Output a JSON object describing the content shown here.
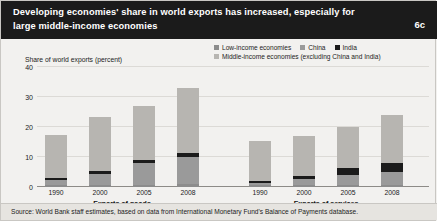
{
  "header": {
    "title": "Developing economies' share in world exports has increased, especially for large middle-income economies",
    "figure_number": "6c"
  },
  "footer": {
    "source": "Source: World Bank staff estimates, based on data from International Monetary Fund's Balance of Payments database."
  },
  "colors": {
    "low_income": "#8c8c8c",
    "china": "#9a9a9a",
    "india": "#1b1b1b",
    "middle_income": "#b7b5b1",
    "header_background": "#1b1b1b",
    "page_background": "#f2f1ef",
    "gridline": "#dcdad6"
  },
  "chart_data": {
    "type": "bar",
    "title": "Developing economies' share in world exports has increased, especially for large middle-income economies",
    "subtitle": "",
    "xlabel": "",
    "ylabel": "Share of world exports (percent)",
    "ylim": [
      0,
      40
    ],
    "yticks": [
      0,
      10,
      20,
      30,
      40
    ],
    "grid": true,
    "stacked": true,
    "legend_position": "top-right",
    "legend": [
      "Low-income economies",
      "China",
      "India",
      "Middle-income economies (excluding China and India)"
    ],
    "groups": [
      {
        "label": "Exports of goods",
        "categories": [
          "1990",
          "2000",
          "2005",
          "2008"
        ],
        "series": [
          {
            "name": "Low-income economies",
            "values": [
              0.6,
              0.6,
              0.7,
              0.9
            ]
          },
          {
            "name": "China",
            "values": [
              1.8,
              3.9,
              7.3,
              9.1
            ]
          },
          {
            "name": "India",
            "values": [
              0.6,
              0.7,
              1.0,
              1.2
            ]
          },
          {
            "name": "Middle-income economies (excluding China and India)",
            "values": [
              14.5,
              18.3,
              18.0,
              21.8
            ]
          }
        ],
        "totals": [
          17.5,
          23.5,
          27.0,
          33.0
        ]
      },
      {
        "label": "Exports of services",
        "categories": [
          "1990",
          "2000",
          "2005",
          "2008"
        ],
        "series": [
          {
            "name": "Low-income economies",
            "values": [
              0.6,
              0.6,
              0.7,
              0.8
            ]
          },
          {
            "name": "China",
            "values": [
              0.7,
              2.0,
              3.3,
              4.3
            ]
          },
          {
            "name": "India",
            "values": [
              0.6,
              1.1,
              2.3,
              3.0
            ]
          },
          {
            "name": "Middle-income economies (excluding China and India)",
            "values": [
              13.6,
              13.3,
              13.7,
              15.9
            ]
          }
        ],
        "totals": [
          15.5,
          17.0,
          20.0,
          24.0
        ]
      }
    ]
  }
}
